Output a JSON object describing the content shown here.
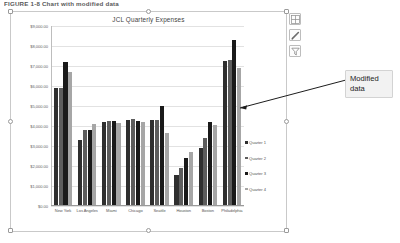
{
  "figure": {
    "caption": "FIGURE 1-8  Chart with modified data"
  },
  "chart_object": {
    "title": "JCL Quarterly Expenses",
    "selected": true,
    "handles": [
      "top-left",
      "top-center",
      "top-right",
      "middle-left",
      "middle-right",
      "bottom-left",
      "bottom-center",
      "bottom-right"
    ]
  },
  "chart_tools": [
    {
      "name": "chart-elements-icon",
      "label": "Chart Elements",
      "glyph": "+"
    },
    {
      "name": "chart-styles-icon",
      "label": "Chart Styles",
      "glyph": "brush"
    },
    {
      "name": "chart-filters-icon",
      "label": "Chart Filters",
      "glyph": "funnel"
    }
  ],
  "callout": {
    "line1": "Modified",
    "line2": "data"
  },
  "colors": {
    "series1": "#2f2f2f",
    "series2": "#5d5d5d",
    "series3": "#1a1a1a",
    "series4": "#a6a6a6",
    "gridline": "#e2e2e2",
    "axis": "#9a9a9a",
    "callout_bg": "#f2f2f2"
  },
  "chart_data": {
    "type": "bar",
    "title": "JCL Quarterly Expenses",
    "xlabel": "",
    "ylabel": "",
    "ylim": [
      0,
      9000
    ],
    "grid": true,
    "legend_position": "right",
    "ytick_labels": [
      "$9,000.00",
      "$8,000.00",
      "$7,000.00",
      "$6,000.00",
      "$5,000.00",
      "$4,000.00",
      "$3,000.00",
      "$2,000.00",
      "$1,000.00",
      "$0.00"
    ],
    "ytick_values": [
      9000,
      8000,
      7000,
      6000,
      5000,
      4000,
      3000,
      2000,
      1000,
      0
    ],
    "categories": [
      "New York",
      "Los Angeles",
      "Miami",
      "Chicago",
      "Seattle",
      "Houston",
      "Boston",
      "Philadelphia"
    ],
    "series": [
      {
        "name": "Quarter 1",
        "color": "#2f2f2f",
        "values": [
          5900,
          3300,
          4200,
          4300,
          4300,
          1550,
          2900,
          7250
        ]
      },
      {
        "name": "Quarter 2",
        "color": "#5d5d5d",
        "values": [
          5900,
          3800,
          4250,
          4350,
          4300,
          1900,
          3400,
          7300
        ]
      },
      {
        "name": "Quarter 3",
        "color": "#1a1a1a",
        "values": [
          7200,
          3800,
          4250,
          4250,
          5000,
          2400,
          4200,
          8300
        ]
      },
      {
        "name": "Quarter 4",
        "color": "#a6a6a6",
        "values": [
          6700,
          4100,
          4150,
          4200,
          3650,
          2700,
          4050,
          6900
        ]
      }
    ]
  }
}
